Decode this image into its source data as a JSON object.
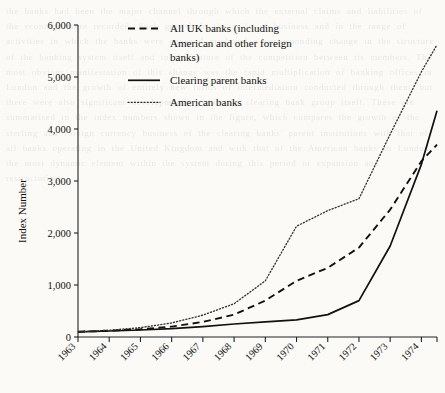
{
  "chart_data": {
    "type": "line",
    "title": "",
    "xlabel": "",
    "ylabel": "Index Number",
    "xlim": [
      1963,
      1974.5
    ],
    "ylim": [
      0,
      6000
    ],
    "grid": false,
    "legend_position": "top-center",
    "y_ticks": [
      "0",
      "1,000",
      "2,000",
      "3,000",
      "4,000",
      "5,000",
      "6,000"
    ],
    "y_tick_values": [
      0,
      1000,
      2000,
      3000,
      4000,
      5000,
      6000
    ],
    "x_ticks": [
      "1963",
      "1964",
      "1965",
      "1966",
      "1967",
      "1968",
      "1969",
      "1970",
      "1971",
      "1972",
      "1973",
      "1974"
    ],
    "x": [
      1963,
      1964,
      1965,
      1966,
      1967,
      1968,
      1969,
      1970,
      1971,
      1972,
      1973,
      1974,
      1974.5
    ],
    "series": [
      {
        "name": "All UK banks (including American and other foreign banks)",
        "style": "dashed",
        "values": [
          100,
          120,
          150,
          200,
          290,
          430,
          700,
          1080,
          1330,
          1720,
          2450,
          3380,
          3700
        ]
      },
      {
        "name": "Clearing parent banks",
        "style": "solid",
        "values": [
          100,
          115,
          135,
          160,
          200,
          250,
          290,
          330,
          430,
          700,
          1750,
          3320,
          4350
        ]
      },
      {
        "name": "American banks",
        "style": "dotted",
        "values": [
          100,
          130,
          180,
          270,
          420,
          640,
          1080,
          2130,
          2430,
          2660,
          3900,
          5100,
          5620
        ]
      }
    ]
  },
  "legend": {
    "entries": [
      {
        "label_line1": "All UK banks (including",
        "label_line2": "American and other foreign",
        "label_line3": "banks)",
        "style": "dashed"
      },
      {
        "label_line1": "Clearing parent banks",
        "label_line2": "",
        "label_line3": "",
        "style": "solid"
      },
      {
        "label_line1": "American banks",
        "label_line2": "",
        "label_line3": "",
        "style": "dotted"
      }
    ]
  },
  "axes": {
    "y_title": "Index Number"
  },
  "bleed_text": "the banks had been the major channel through which the external claims and liabilities of the economy were recorded. Such growth in the scale of business and in the range of activities in which the banks were engaged produced a corresponding change in the structure of the banking system itself and in the nature of the competition between its members. The most obvious manifestation of this change was the rapid multiplication of banking offices in London and the growth of entirely new forms of intermediation conducted through them, but there were also significant developments within the clearing bank group itself. These are summarised in the index numbers shown in the figure, which compares the growth of the sterling and foreign currency business of the clearing banks' parent institutions with that of all banks operating in the United Kingdom and with that of the American banks in London, the most dynamic element within the system during this period of expansion and restructuring."
}
